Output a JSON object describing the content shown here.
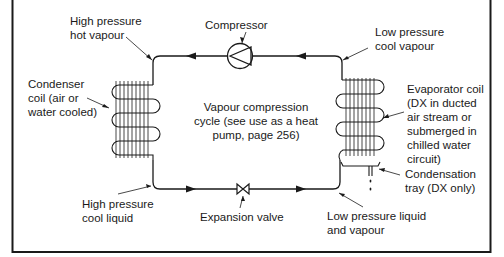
{
  "title": "Vapour compression cycle (see use as a heat pump, page 256)",
  "colors": {
    "ink": "#1a1a1a",
    "background": "#ffffff"
  },
  "labels": {
    "high_pressure_hot_vapour": "High pressure\nhot vapour",
    "compressor": "Compressor",
    "low_pressure_cool_vapour": "Low pressure\ncool vapour",
    "condenser_coil": "Condenser\ncoil (air or\nwater cooled)",
    "cycle_caption": "Vapour compression\ncycle (see use as a heat\npump, page 256)",
    "evaporator_coil": "Evaporator coil\n(DX in ducted\nair stream or\nsubmerged in\nchilled water\ncircuit)",
    "condensation_tray": "Condensation\ntray (DX only)",
    "high_pressure_cool_liquid": "High pressure\ncool liquid",
    "expansion_valve": "Expansion valve",
    "low_pressure_liquid_vapour": "Low pressure liquid\nand vapour"
  },
  "components": [
    {
      "name": "compressor",
      "symbol": "circle-with-triangle"
    },
    {
      "name": "condenser-coil",
      "symbol": "serpentine-finned-coil"
    },
    {
      "name": "evaporator-coil",
      "symbol": "serpentine-finned-coil"
    },
    {
      "name": "expansion-valve",
      "symbol": "bowtie-valve"
    },
    {
      "name": "condensation-tray",
      "symbol": "tray-with-drain"
    }
  ],
  "flow_direction": "counter-clockwise"
}
